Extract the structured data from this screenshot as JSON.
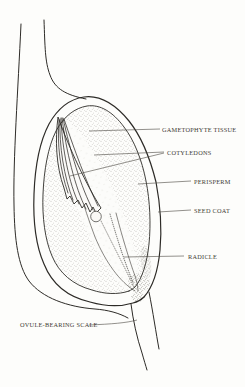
{
  "figure": {
    "labels": {
      "gametophyte_tissue": "GAMETOPHYTE TISSUE",
      "cotyledons": "COTYLEDONS",
      "perisperm": "PERISPERM",
      "seed_coat": "SEED COAT",
      "radicle": "RADICLE",
      "ovule_bearing_scale": "OVULE-BEARING SCALE"
    },
    "colors": {
      "background": "#fdfdfb",
      "line": "#2d2b27",
      "label_text": "#3f3b34",
      "stipple": "#6e6a62"
    }
  }
}
